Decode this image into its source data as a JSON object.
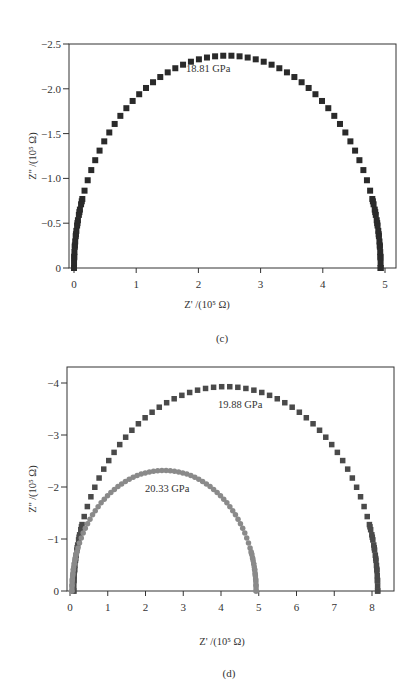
{
  "chart_data": [
    {
      "panel": "(c)",
      "type": "scatter",
      "title": "",
      "xlabel": "Z' /(10^5 Ω)",
      "ylabel": "Z'' /(10^5 Ω)",
      "xlim": [
        0,
        5
      ],
      "ylim": [
        0,
        -2.5
      ],
      "x_ticks": [
        "0",
        "1",
        "2",
        "3",
        "4",
        "5"
      ],
      "y_ticks": [
        "0",
        "-0.5",
        "-1.0",
        "-1.5",
        "-2.0",
        "-2.5"
      ],
      "grid": false,
      "legend": null,
      "annotations": [
        {
          "text": "18.81 GPa",
          "x": 2.45,
          "y": -2.2
        }
      ],
      "series": [
        {
          "name": "18.81 GPa",
          "marker": "square",
          "color": "#2a2a2a",
          "shape": "semicircle",
          "x_start": 0.0,
          "x_end": 4.93,
          "peak_y": -2.37,
          "peak_x": 2.45,
          "points": 60
        }
      ]
    },
    {
      "panel": "(d)",
      "type": "scatter",
      "title": "",
      "xlabel": "Z' /(10^5 Ω)",
      "ylabel": "Z'' /(10^5 Ω)",
      "xlim": [
        0,
        8
      ],
      "ylim": [
        0,
        -4
      ],
      "x_ticks": [
        "0",
        "1",
        "2",
        "3",
        "4",
        "5",
        "6",
        "7",
        "8"
      ],
      "y_ticks": [
        "0",
        "-1",
        "-2",
        "-3",
        "-4"
      ],
      "grid": false,
      "legend": null,
      "annotations": [
        {
          "text": "19.88 GPa",
          "x": 4.7,
          "y": -3.75
        },
        {
          "text": "20.33 GPa",
          "x": 2.6,
          "y": -2.05
        }
      ],
      "series": [
        {
          "name": "19.88 GPa",
          "marker": "square",
          "color": "#4a4a4a",
          "shape": "semicircle",
          "x_start": 0.1,
          "x_end": 8.15,
          "peak_y": -3.93,
          "peak_x": 4.2,
          "points": 60
        },
        {
          "name": "20.33 GPa",
          "marker": "circle",
          "color": "#8a8a8a",
          "shape": "semicircle",
          "x_start": 0.05,
          "x_end": 4.93,
          "peak_y": -2.32,
          "peak_x": 2.5,
          "points": 70
        }
      ]
    }
  ],
  "panels": {
    "c": {
      "caption": "(c)",
      "xlabel": "Z' /(10⁵ Ω)",
      "ylabel": "Z'' /(10⁵ Ω)",
      "annotation": "18.81 GPa",
      "x_ticks": [
        "0",
        "1",
        "2",
        "3",
        "4",
        "5"
      ],
      "y_ticks": [
        "0",
        "-0.5",
        "-1.0",
        "-1.5",
        "-2.0",
        "-2.5"
      ]
    },
    "d": {
      "caption": "(d)",
      "xlabel": "Z' /(10⁵ Ω)",
      "ylabel": "Z'' /(10⁵ Ω)",
      "annotation_1": "19.88 GPa",
      "annotation_2": "20.33 GPa",
      "x_ticks": [
        "0",
        "1",
        "2",
        "3",
        "4",
        "5",
        "6",
        "7",
        "8"
      ],
      "y_ticks": [
        "0",
        "-1",
        "-2",
        "-3",
        "-4"
      ]
    }
  }
}
